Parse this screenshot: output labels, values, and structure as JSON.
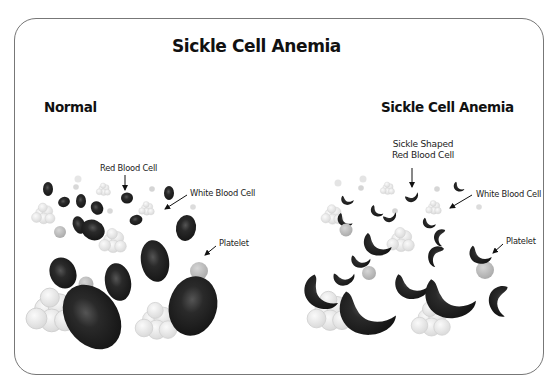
{
  "title": "Sickle Cell Anemia",
  "panels": {
    "normal": {
      "heading": "Normal",
      "labels": {
        "red_blood_cell": "Red Blood Cell",
        "white_blood_cell": "White Blood Cell",
        "platelet": "Platelet"
      }
    },
    "sickle": {
      "heading": "Sickle Cell Anemia",
      "labels": {
        "sickle_rbc_line1": "Sickle Shaped",
        "sickle_rbc_line2": "Red Blood Cell",
        "white_blood_cell": "White Blood Cell",
        "platelet": "Platelet"
      }
    }
  },
  "colors": {
    "red_cell": "#1f1f1f",
    "white_cell": "#ebebeb",
    "platelet": "#c4c4c4",
    "border": "#777777"
  }
}
